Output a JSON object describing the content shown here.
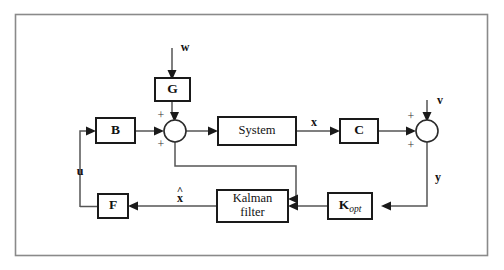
{
  "figure": {
    "domain": "diagram",
    "kind": "control-system-block-diagram",
    "background_color": "#ffffff",
    "frame_color": "#8a8a8a",
    "wire_color": "#555555",
    "block_stroke_color": "#1a1a1a",
    "text_color": "#111111"
  },
  "blocks": {
    "gain_b": {
      "label": "B"
    },
    "gain_g": {
      "label": "G"
    },
    "system": {
      "label": "System"
    },
    "gain_c": {
      "label": "C"
    },
    "gain_f": {
      "label": "F"
    },
    "kalman": {
      "label_line1": "Kalman",
      "label_line2": "filter"
    },
    "kopt": {
      "label_main": "K",
      "label_sub": "opt"
    }
  },
  "signals": {
    "process_noise": "w",
    "measurement_noise": "v",
    "state": "x",
    "output": "y",
    "control": "u",
    "state_estimate_base": "x",
    "state_estimate_hat": "^"
  },
  "summing_junctions": {
    "plant_input": {
      "name": "plant-summing-junction",
      "sign_top": "+",
      "sign_left": "+"
    },
    "output_measurement": {
      "name": "measurement-summing-junction",
      "sign_top": "+",
      "sign_left": "+"
    }
  }
}
